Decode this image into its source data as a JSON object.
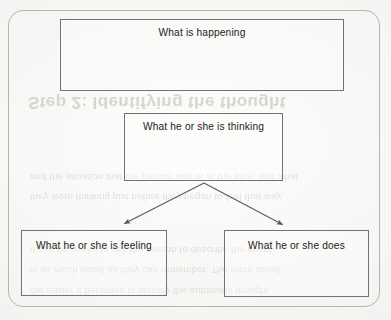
{
  "document": {
    "type": "cognitive-model-diagram",
    "paper_color": "#f6f5f3",
    "ink_color": "#1d1c1b",
    "frame_color": "#b6b4b1",
    "box_border_color": "#6f6d6b"
  },
  "frame": {
    "name": "outer-rounded-border"
  },
  "diagram": {
    "nodes": [
      {
        "id": "what-happening",
        "label": "What is happening"
      },
      {
        "id": "thinking",
        "label": "What he or she is thinking"
      },
      {
        "id": "feeling",
        "label": "What he or she is feeling"
      },
      {
        "id": "does",
        "label": "What he or she does"
      }
    ],
    "arrows": [
      {
        "id": "thinking-to-feeling",
        "from": "thinking",
        "to": "feeling",
        "head": "arrowhead"
      },
      {
        "id": "thinking-to-does",
        "from": "thinking",
        "to": "does",
        "head": "arrowhead"
      }
    ],
    "arrow_color": "#5c5a58"
  },
  "bleed_through": {
    "heading": "Step 2: Identifying the thought",
    "lines": [
      "and the situation that the person was in at the time, and what",
      "they were thinking just before they began to feel that way.",
      "It can be useful to ask the person to describe the event",
      "in as much detail as they can remember. The more detail",
      "the easier it becomes to identify the automatic thought."
    ]
  }
}
